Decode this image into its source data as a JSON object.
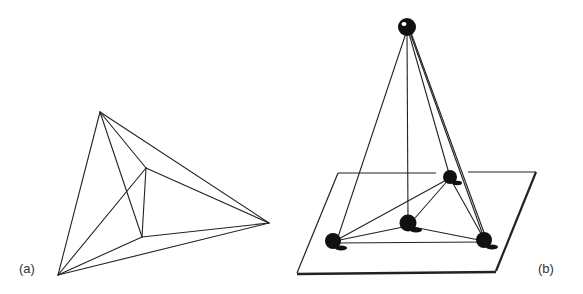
{
  "figure": {
    "panels": [
      {
        "label": "(a)",
        "description": "Planar wireframe projection of a tetrahedron-like graph",
        "vertices": {
          "top": [
            100,
            112
          ],
          "right": [
            269,
            223
          ],
          "bottom_left": [
            58,
            275
          ],
          "inner_upper": [
            146,
            168
          ],
          "inner_lower": [
            142,
            237
          ]
        }
      },
      {
        "label": "(b)",
        "description": "Pyramid with apex ball above a plane; four balls on the plane connected by rods",
        "apex": [
          407,
          27
        ],
        "base_balls": [
          [
            333,
            241
          ],
          [
            408,
            224
          ],
          [
            450,
            177
          ],
          [
            485,
            240
          ]
        ],
        "plane": [
          [
            338,
            173
          ],
          [
            536,
            172
          ],
          [
            496,
            271
          ],
          [
            297,
            273
          ]
        ]
      }
    ],
    "colors": {
      "line": "#222222",
      "ball": "#111111",
      "background": "#ffffff"
    }
  }
}
